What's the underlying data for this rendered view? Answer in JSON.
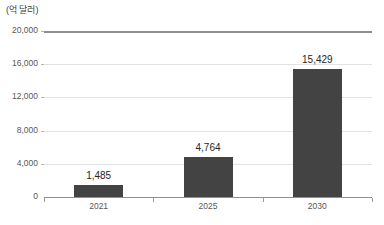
{
  "chart_data": {
    "type": "bar",
    "title": "",
    "subtitle": "",
    "unit_label": "(억 달러)",
    "xlabel": "",
    "ylabel": "",
    "categories": [
      "2021",
      "2025",
      "2030"
    ],
    "values": [
      1485,
      4764,
      15429
    ],
    "value_labels": [
      "1,485",
      "4,764",
      "15,429"
    ],
    "series": [
      {
        "name": "",
        "values": [
          1485,
          4764,
          15429
        ]
      }
    ],
    "ylim": [
      0,
      20000
    ],
    "yticks": [
      0,
      4000,
      8000,
      12000,
      16000,
      20000
    ],
    "ytick_labels": [
      "0",
      "4,000",
      "8,000",
      "12,000",
      "16,000",
      "20,000"
    ],
    "grid": true,
    "legend": false,
    "legend_position": "none",
    "bar_color": "#434343",
    "gridline_color": "#e2e2e2",
    "axis_color": "#8f8f8f",
    "text_color": "#575757",
    "background_color": "#ffffff"
  },
  "footer": {
    "source_note": ""
  }
}
